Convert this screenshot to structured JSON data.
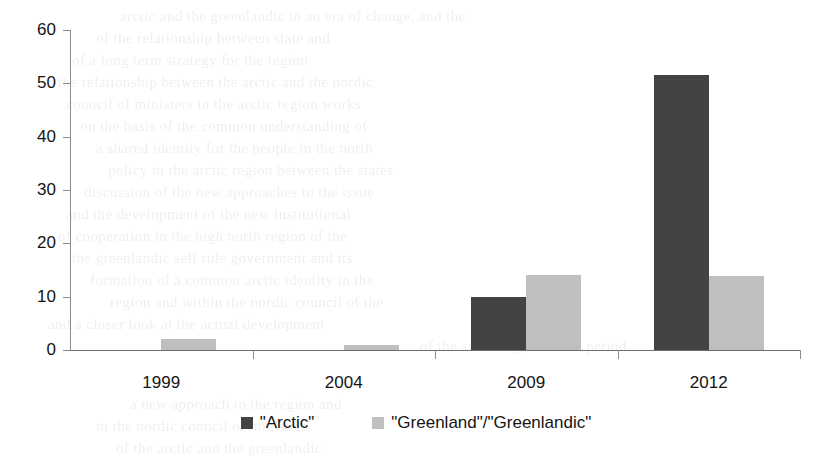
{
  "chart_data": {
    "type": "bar",
    "title": "",
    "subtitle": "",
    "xlabel": "",
    "ylabel": "",
    "categories": [
      "1999",
      "2004",
      "2009",
      "2012"
    ],
    "series": [
      {
        "name": "\"Arctic\"",
        "color": "#434343",
        "values": [
          0,
          0,
          10,
          51.5
        ]
      },
      {
        "name": "\"Greenland\"/\"Greenlandic\"",
        "color": "#bfbfbf",
        "values": [
          2,
          1,
          14,
          13.8
        ]
      }
    ],
    "ylim": [
      0,
      60
    ],
    "ytick_values": [
      0,
      10,
      20,
      30,
      40,
      50,
      60
    ],
    "ytick_labels": [
      "0",
      "10",
      "20",
      "30",
      "40",
      "50",
      "60"
    ],
    "grid": false,
    "legend_position": "bottom",
    "annotations": []
  },
  "legend": {
    "items": [
      {
        "label": "\"Arctic\"",
        "color": "#434343"
      },
      {
        "label": "\"Greenland\"/\"Greenlandic\"",
        "color": "#bfbfbf"
      }
    ]
  },
  "axis": {
    "y_line_color": "#8c8c8c",
    "x_line_color": "#6e6e6e"
  },
  "background_text": {
    "lines": [
      {
        "text": "arctic and the greenlandic in an era of change, and the",
        "x": 120,
        "y": 8,
        "size": 15
      },
      {
        "text": "of the relationship between state and",
        "x": 96,
        "y": 30,
        "size": 15
      },
      {
        "text": "of a long term strategy for the region",
        "x": 72,
        "y": 52,
        "size": 15
      },
      {
        "text": "the relationship between the arctic and the nordic",
        "x": 58,
        "y": 74,
        "size": 15
      },
      {
        "text": "council of ministers in the arctic region works",
        "x": 66,
        "y": 96,
        "size": 15
      },
      {
        "text": "on the basis of the common understanding of",
        "x": 80,
        "y": 118,
        "size": 15
      },
      {
        "text": "a shared identity for the people in the north",
        "x": 96,
        "y": 140,
        "size": 15
      },
      {
        "text": "policy in the arctic region between the states",
        "x": 108,
        "y": 162,
        "size": 15
      },
      {
        "text": "discussion of the new approaches to the issue",
        "x": 84,
        "y": 184,
        "size": 15
      },
      {
        "text": "and the development of the new institutional",
        "x": 66,
        "y": 206,
        "size": 15
      },
      {
        "text": "of cooperation in the high north region of the",
        "x": 58,
        "y": 228,
        "size": 15
      },
      {
        "text": "the greenlandic self rule government and its",
        "x": 72,
        "y": 250,
        "size": 15
      },
      {
        "text": "formation of a common arctic identity in the",
        "x": 90,
        "y": 272,
        "size": 15
      },
      {
        "text": "region and within the nordic council of the",
        "x": 110,
        "y": 294,
        "size": 15
      },
      {
        "text": "and a closer look at the actual development",
        "x": 48,
        "y": 316,
        "size": 15
      },
      {
        "text": "of the arctic region in the period",
        "x": 420,
        "y": 338,
        "size": 15
      },
      {
        "text": "a new approach to the region and",
        "x": 130,
        "y": 396,
        "size": 15
      },
      {
        "text": "in the nordic council of ministers",
        "x": 96,
        "y": 418,
        "size": 15
      },
      {
        "text": "of the arctic and the greenlandic",
        "x": 116,
        "y": 440,
        "size": 15
      }
    ]
  }
}
